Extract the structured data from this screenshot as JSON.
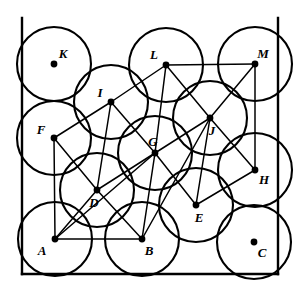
{
  "figure": {
    "width": 302,
    "height": 295,
    "background_color": "#ffffff",
    "stroke_color": "#000000"
  },
  "square": {
    "label": "bounding-square",
    "left": 22,
    "top": 18,
    "right": 278,
    "bottom": 274,
    "side_length": 256,
    "stroke_width": 2.4
  },
  "circles": {
    "count": 13,
    "radius": 37,
    "stroke_width": 2.1,
    "fill": "none",
    "items": [
      {
        "label": "A",
        "cx": 55,
        "cy": 239,
        "label_dx": -13,
        "label_dy": 13
      },
      {
        "label": "B",
        "cx": 142,
        "cy": 239,
        "label_dx": 7,
        "label_dy": 13
      },
      {
        "label": "C",
        "cx": 254,
        "cy": 242,
        "label_dx": 8,
        "label_dy": 12
      },
      {
        "label": "D",
        "cx": 97,
        "cy": 190,
        "label_dx": -3,
        "label_dy": 14
      },
      {
        "label": "E",
        "cx": 196,
        "cy": 205,
        "label_dx": 3,
        "label_dy": 14
      },
      {
        "label": "F",
        "cx": 54,
        "cy": 138,
        "label_dx": -13,
        "label_dy": -7
      },
      {
        "label": "G",
        "cx": 155,
        "cy": 153,
        "label_dx": -2,
        "label_dy": -10
      },
      {
        "label": "H",
        "cx": 255,
        "cy": 170,
        "label_dx": 9,
        "label_dy": 11
      },
      {
        "label": "I",
        "cx": 111,
        "cy": 102,
        "label_dx": -11,
        "label_dy": -8
      },
      {
        "label": "J",
        "cx": 210,
        "cy": 118,
        "label_dx": 2,
        "label_dy": 14
      },
      {
        "label": "K",
        "cx": 54,
        "cy": 64,
        "label_dx": 9,
        "label_dy": -9
      },
      {
        "label": "L",
        "cx": 166,
        "cy": 65,
        "label_dx": -12,
        "label_dy": -9
      },
      {
        "label": "M",
        "cx": 255,
        "cy": 64,
        "label_dx": 8,
        "label_dy": -9
      }
    ]
  },
  "chords": {
    "description": "Line segments joining centers of mutually tangent circles",
    "stroke_width": 1.5,
    "pairs": [
      [
        "A",
        "B"
      ],
      [
        "A",
        "D"
      ],
      [
        "A",
        "F"
      ],
      [
        "A",
        "G"
      ],
      [
        "B",
        "D"
      ],
      [
        "B",
        "G"
      ],
      [
        "B",
        "J"
      ],
      [
        "D",
        "F"
      ],
      [
        "D",
        "G"
      ],
      [
        "D",
        "I"
      ],
      [
        "E",
        "G"
      ],
      [
        "E",
        "H"
      ],
      [
        "E",
        "J"
      ],
      [
        "F",
        "I"
      ],
      [
        "G",
        "I"
      ],
      [
        "G",
        "J"
      ],
      [
        "G",
        "L"
      ],
      [
        "H",
        "J"
      ],
      [
        "H",
        "M"
      ],
      [
        "I",
        "L"
      ],
      [
        "J",
        "L"
      ],
      [
        "J",
        "M"
      ],
      [
        "L",
        "M"
      ]
    ]
  },
  "free_circles": {
    "description": "Circles whose centers carry a dot but no connecting chords",
    "labels": [
      "C",
      "K"
    ]
  }
}
